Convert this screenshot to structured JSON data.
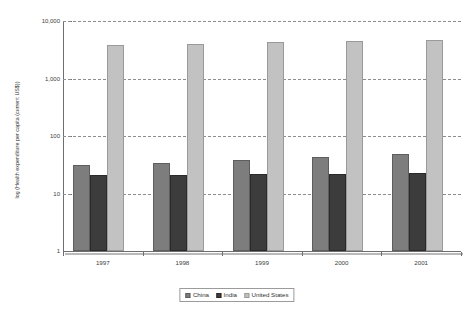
{
  "chart_data": {
    "type": "bar",
    "title": "",
    "subtitle": "",
    "xlabel": "",
    "ylabel": "log (Health expenditure per capita (current US$))",
    "categories": [
      "1997",
      "1998",
      "1999",
      "2000",
      "2001"
    ],
    "series": [
      {
        "name": "China",
        "color": "#7d7d7d",
        "values": [
          31,
          34,
          38,
          43,
          49
        ]
      },
      {
        "name": "India",
        "color": "#3c3c3c",
        "values": [
          21,
          21,
          22,
          22,
          23
        ]
      },
      {
        "name": "United States",
        "color": "#c2c2c2",
        "values": [
          3900,
          4050,
          4250,
          4500,
          4750
        ]
      }
    ],
    "y_scale": "log",
    "ylim": [
      1,
      10000
    ],
    "y_ticks": [
      {
        "value": 1,
        "label": "1"
      },
      {
        "value": 10,
        "label": "10"
      },
      {
        "value": 100,
        "label": "100"
      },
      {
        "value": 1000,
        "label": "1,000"
      },
      {
        "value": 10000,
        "label": "10,000"
      }
    ],
    "grid": "horizontal-dashed",
    "legend_position": "bottom-center",
    "legend_entries": [
      "China",
      "India",
      "United States"
    ]
  },
  "axis": {
    "y_title": "log (Health expenditure per capita (current US$))",
    "y_tick_labels": [
      "10,000",
      "1,000",
      "100",
      "10",
      "1"
    ],
    "x_tick_labels": [
      "1997",
      "1998",
      "1999",
      "2000",
      "2001"
    ]
  },
  "legend": {
    "items": [
      {
        "label": "China"
      },
      {
        "label": "India"
      },
      {
        "label": "United States"
      }
    ]
  }
}
